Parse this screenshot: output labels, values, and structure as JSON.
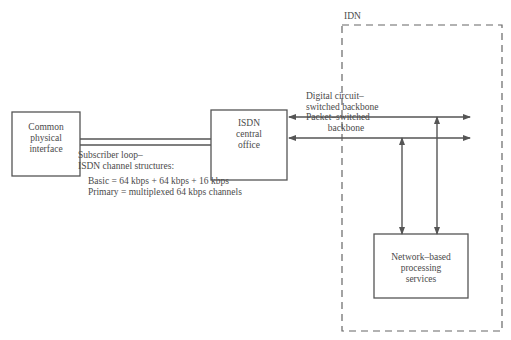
{
  "diagram": {
    "idn_label": "IDN",
    "common_interface": {
      "lines": [
        "Common",
        "physical",
        "interface"
      ]
    },
    "isdn_office": {
      "lines": [
        "ISDN",
        "central",
        "office"
      ]
    },
    "digital_backbone": {
      "lines": [
        "Digital circuit–",
        "switched backbone"
      ]
    },
    "packet_backbone": {
      "lines": [
        "Packet–switched",
        "backbone"
      ]
    },
    "network_services": {
      "lines": [
        "Network–based",
        "processing",
        "services"
      ]
    },
    "subscriber_loop": {
      "title_lines": [
        "Subscriber loop–",
        "ISDN channel structures:"
      ],
      "basic": "Basic = 64 kbps + 64 kbps + 16 kbps",
      "primary": "Primary = multiplexed 64 kbps channels"
    },
    "colors": {
      "line": "#555555",
      "text": "#4a4a4a",
      "dash": "#666666"
    }
  }
}
